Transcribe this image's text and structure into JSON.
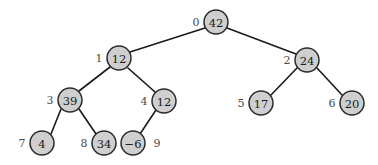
{
  "figure": {
    "background_color": "#ffffff",
    "node_fill_color": "#cfcfcf",
    "node_stroke_color": "#2b2b2b",
    "edge_color": "#1a1a1a",
    "index_label_color": "#4a4a4a",
    "value_label_color": "#1a1a1a"
  },
  "chart_data": {
    "type": "diagram",
    "diagram_kind": "binary-tree",
    "title": "",
    "node_radius": 12,
    "nodes": [
      {
        "index": "0",
        "value": "42",
        "cx": 216,
        "cy": 22,
        "index_x": 196,
        "index_y": 22
      },
      {
        "index": "1",
        "value": "12",
        "cx": 119,
        "cy": 58,
        "index_x": 99,
        "index_y": 58
      },
      {
        "index": "2",
        "value": "24",
        "cx": 307,
        "cy": 60,
        "index_x": 287,
        "index_y": 60
      },
      {
        "index": "3",
        "value": "39",
        "cx": 70,
        "cy": 100,
        "index_x": 50,
        "index_y": 100
      },
      {
        "index": "4",
        "value": "12",
        "cx": 164,
        "cy": 101,
        "index_x": 144,
        "index_y": 101
      },
      {
        "index": "5",
        "value": "17",
        "cx": 261,
        "cy": 103,
        "index_x": 241,
        "index_y": 103
      },
      {
        "index": "6",
        "value": "20",
        "cx": 352,
        "cy": 103,
        "index_x": 332,
        "index_y": 103
      },
      {
        "index": "7",
        "value": "4",
        "cx": 42,
        "cy": 143,
        "index_x": 22,
        "index_y": 143
      },
      {
        "index": "8",
        "value": "34",
        "cx": 104,
        "cy": 143,
        "index_x": 84,
        "index_y": 143
      },
      {
        "index": "9",
        "value": "−6",
        "cx": 133,
        "cy": 143,
        "index_x": 157,
        "index_y": 143
      }
    ],
    "edges": [
      {
        "from": "0",
        "to": "1",
        "x1": 205,
        "y1": 28,
        "x2": 130,
        "y2": 52
      },
      {
        "from": "0",
        "to": "2",
        "x1": 227,
        "y1": 28,
        "x2": 296,
        "y2": 54
      },
      {
        "from": "1",
        "to": "3",
        "x1": 110,
        "y1": 67,
        "x2": 79,
        "y2": 91
      },
      {
        "from": "1",
        "to": "4",
        "x1": 128,
        "y1": 68,
        "x2": 155,
        "y2": 92
      },
      {
        "from": "2",
        "to": "5",
        "x1": 297,
        "y1": 68,
        "x2": 271,
        "y2": 95
      },
      {
        "from": "2",
        "to": "6",
        "x1": 317,
        "y1": 68,
        "x2": 342,
        "y2": 95
      },
      {
        "from": "3",
        "to": "7",
        "x1": 61,
        "y1": 109,
        "x2": 51,
        "y2": 134
      },
      {
        "from": "3",
        "to": "8",
        "x1": 79,
        "y1": 109,
        "x2": 96,
        "y2": 134
      },
      {
        "from": "4",
        "to": "9",
        "x1": 156,
        "y1": 110,
        "x2": 140,
        "y2": 134
      }
    ],
    "node_count": 10,
    "values_in_index_order": [
      "42",
      "12",
      "24",
      "39",
      "12",
      "17",
      "20",
      "4",
      "34",
      "−6"
    ]
  }
}
